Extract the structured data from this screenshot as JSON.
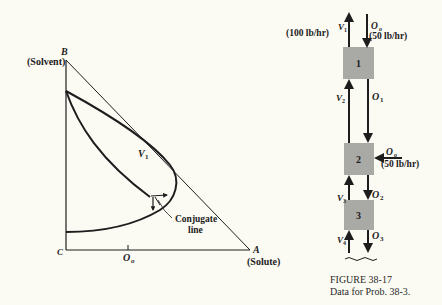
{
  "phase_diagram": {
    "vertex_b": "B",
    "vertex_b_label": "(Solvent)",
    "vertex_a": "A",
    "vertex_a_label": "(Solute)",
    "vertex_c": "C",
    "curve_label": "V",
    "curve_label_sub": "1",
    "tick_label": "O",
    "tick_label_sub": "o",
    "annotation_line1": "Conjugate",
    "annotation_line2": "line"
  },
  "cascade": {
    "stages": [
      {
        "number": "1"
      },
      {
        "number": "2"
      },
      {
        "number": "3"
      }
    ],
    "streams": {
      "v1": {
        "name": "V",
        "sub": "1",
        "rate": "(100 lb/hr)"
      },
      "o0_top": {
        "name": "O",
        "sub": "o",
        "rate": "(50 lb/hr)"
      },
      "v2": {
        "name": "V",
        "sub": "2"
      },
      "o1": {
        "name": "O",
        "sub": "1"
      },
      "o0_side": {
        "name": "O",
        "sub": "o",
        "rate": "(50 lb/hr)"
      },
      "v3": {
        "name": "V",
        "sub": "3"
      },
      "o2": {
        "name": "O",
        "sub": "2"
      },
      "v4": {
        "name": "V",
        "sub": "4"
      },
      "o3": {
        "name": "O",
        "sub": "3"
      }
    },
    "box_color": "#a9a9a6"
  },
  "caption": {
    "title": "FIGURE 38-17",
    "text": "Data for Prob. 38-3."
  }
}
